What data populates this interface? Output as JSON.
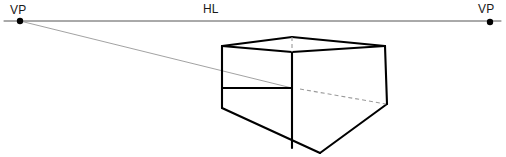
{
  "diagram": {
    "type": "perspective-construction-drawing",
    "canvas": {
      "width": 506,
      "height": 157,
      "background": "#ffffff"
    },
    "labels": {
      "vp_left": "VP",
      "vp_right": "VP",
      "horizon_line": "HL"
    },
    "colors": {
      "ink": "#000000",
      "horizon_line": "#555555",
      "construction_line": "#8a8a8a",
      "hidden_line": "#9a9a9a",
      "label_text": "#1a1a1a"
    },
    "horizon": {
      "name": "horizon-line",
      "y": 21,
      "x_start": 4,
      "x_end": 501,
      "stroke_width": 1
    },
    "vanishing_points": [
      {
        "name": "vanishing-point-left",
        "label": "VP",
        "x": 20,
        "y": 21,
        "radius": 3.2
      },
      {
        "name": "vanishing-point-right",
        "label": "VP",
        "x": 490,
        "y": 22,
        "radius": 3.2
      }
    ],
    "box": {
      "name": "perspective-box",
      "vertices": {
        "top_front_left": {
          "x": 222,
          "y": 46
        },
        "top_back_center": {
          "x": 292,
          "y": 37
        },
        "top_front_right": {
          "x": 385,
          "y": 46
        },
        "top_near_corner": {
          "x": 292,
          "y": 52
        },
        "mid_near_corner": {
          "x": 292,
          "y": 88
        },
        "bottom_left": {
          "x": 222,
          "y": 108
        },
        "bottom_right": {
          "x": 387,
          "y": 104
        },
        "bottom_front": {
          "x": 320,
          "y": 153
        }
      },
      "solid_edges": [
        {
          "name": "top-left-edge",
          "from": [
            222,
            46
          ],
          "to": [
            292,
            37
          ]
        },
        {
          "name": "top-right-edge",
          "from": [
            292,
            37
          ],
          "to": [
            385,
            46
          ]
        },
        {
          "name": "top-near-left-edge",
          "from": [
            222,
            46
          ],
          "to": [
            292,
            52
          ]
        },
        {
          "name": "top-near-right-edge",
          "from": [
            292,
            52
          ],
          "to": [
            385,
            46
          ]
        },
        {
          "name": "left-vertical-edge",
          "from": [
            222,
            46
          ],
          "to": [
            222,
            108
          ]
        },
        {
          "name": "right-vertical-edge",
          "from": [
            385,
            46
          ],
          "to": [
            387,
            104
          ]
        },
        {
          "name": "near-vertical-edge",
          "from": [
            292,
            52
          ],
          "to": [
            292,
            148
          ]
        },
        {
          "name": "floor-left-edge",
          "from": [
            222,
            88
          ],
          "to": [
            292,
            88
          ]
        },
        {
          "name": "floor-near-left-edge",
          "from": [
            222,
            108
          ],
          "to": [
            320,
            153
          ]
        },
        {
          "name": "floor-near-right-edge",
          "from": [
            320,
            153
          ],
          "to": [
            387,
            104
          ]
        }
      ],
      "hidden_edges": [
        {
          "name": "hidden-vertical-edge",
          "from": [
            292,
            37
          ],
          "to": [
            292,
            52
          ]
        },
        {
          "name": "hidden-floor-edge",
          "from": [
            300,
            89
          ],
          "to": [
            386,
            104
          ]
        }
      ]
    },
    "construction_lines": [
      {
        "name": "convergence-line-left-vp",
        "from": [
          20,
          21
        ],
        "to": [
          292,
          88
        ],
        "stroke_width": 0.8
      }
    ]
  }
}
